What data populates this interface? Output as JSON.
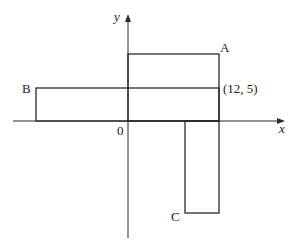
{
  "diagram": {
    "type": "coordinate-plane-rectangles",
    "axes": {
      "x_label": "x",
      "y_label": "y",
      "origin_label": "0"
    },
    "point_label": "(12, 5)",
    "rectangles": [
      {
        "name": "A",
        "label": "A"
      },
      {
        "name": "B",
        "label": "B"
      },
      {
        "name": "C",
        "label": "C"
      }
    ],
    "colors": {
      "stroke": "#2a2a2a",
      "text": "#222222",
      "background": "#ffffff"
    }
  }
}
